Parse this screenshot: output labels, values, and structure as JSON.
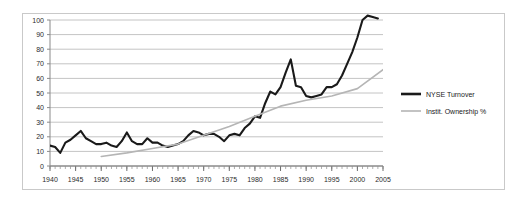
{
  "chart_data": {
    "type": "line",
    "title": "",
    "subtitle": "",
    "xlabel": "",
    "ylabel": "",
    "xlim": [
      1940,
      2005
    ],
    "ylim": [
      0,
      100
    ],
    "ytick_step": 10,
    "xtick_step": 5,
    "minor_xtick_step": 1,
    "grid": "horizontal",
    "legend_position": "right",
    "yticks": [
      0,
      10,
      20,
      30,
      40,
      50,
      60,
      70,
      80,
      90,
      100
    ],
    "xticks": [
      1940,
      1945,
      1950,
      1955,
      1960,
      1965,
      1970,
      1975,
      1980,
      1985,
      1990,
      1995,
      2000,
      2005
    ],
    "series": [
      {
        "name": "NYSE Turnover",
        "color": "#1a1a1a",
        "width": 2.1,
        "x": [
          1940,
          1941,
          1942,
          1943,
          1944,
          1945,
          1946,
          1947,
          1948,
          1949,
          1950,
          1951,
          1952,
          1953,
          1954,
          1955,
          1956,
          1957,
          1958,
          1959,
          1960,
          1961,
          1962,
          1963,
          1964,
          1965,
          1966,
          1967,
          1968,
          1969,
          1970,
          1971,
          1972,
          1973,
          1974,
          1975,
          1976,
          1977,
          1978,
          1979,
          1980,
          1981,
          1982,
          1983,
          1984,
          1985,
          1986,
          1987,
          1988,
          1989,
          1990,
          1991,
          1992,
          1993,
          1994,
          1995,
          1996,
          1997,
          1998,
          1999,
          2000,
          2001,
          2002,
          2003,
          2004
        ],
        "y": [
          14,
          13,
          9,
          16,
          18,
          21,
          24,
          19,
          17,
          15,
          15,
          16,
          14,
          13,
          17,
          23,
          17,
          15,
          15,
          19,
          16,
          16,
          14,
          13,
          14,
          15,
          17,
          21,
          24,
          23,
          21,
          22,
          22,
          20,
          17,
          21,
          22,
          21,
          26,
          29,
          34,
          33,
          43,
          51,
          49,
          54,
          64,
          73,
          55,
          54,
          48,
          47,
          48,
          49,
          54,
          54,
          56,
          62,
          70,
          78,
          88,
          100,
          103,
          102,
          101
        ]
      },
      {
        "name": "Instit. Ownership %",
        "color": "#b5b5b5",
        "width": 1.6,
        "x": [
          1950,
          1955,
          1960,
          1965,
          1970,
          1975,
          1980,
          1985,
          1990,
          1995,
          2000,
          2005
        ],
        "y": [
          6.5,
          9,
          12,
          15,
          21,
          27,
          34,
          41,
          45,
          48,
          53,
          66
        ]
      }
    ],
    "legend": [
      {
        "label": "NYSE Turnover",
        "color": "#1a1a1a",
        "width": 2.6
      },
      {
        "label": "Instit. Ownership %",
        "color": "#b5b5b5",
        "width": 1.6
      }
    ]
  }
}
